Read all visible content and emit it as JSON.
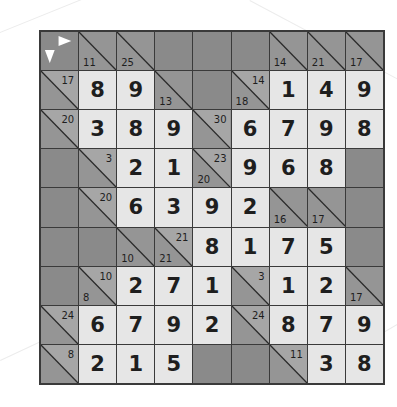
{
  "puzzle": {
    "type": "kakuro",
    "rows": 9,
    "cols": 9,
    "colors": {
      "value_bg": "#e6e6e6",
      "clue_bg": "#959595",
      "black_bg": "#8a8a8a",
      "grid_line": "#3a3a3a",
      "text": "#1e1e1e"
    },
    "cells": [
      [
        {
          "t": "corner"
        },
        {
          "t": "clue",
          "down": "11"
        },
        {
          "t": "clue",
          "down": "25"
        },
        {
          "t": "black"
        },
        {
          "t": "black"
        },
        {
          "t": "black"
        },
        {
          "t": "clue",
          "down": "14"
        },
        {
          "t": "clue",
          "down": "21"
        },
        {
          "t": "clue",
          "down": "17"
        }
      ],
      [
        {
          "t": "clue",
          "right": "17"
        },
        {
          "t": "val",
          "v": "8"
        },
        {
          "t": "val",
          "v": "9"
        },
        {
          "t": "clue",
          "down": "13"
        },
        {
          "t": "black"
        },
        {
          "t": "clue",
          "down": "18",
          "right": "14"
        },
        {
          "t": "val",
          "v": "1"
        },
        {
          "t": "val",
          "v": "4"
        },
        {
          "t": "val",
          "v": "9"
        }
      ],
      [
        {
          "t": "clue",
          "right": "20"
        },
        {
          "t": "val",
          "v": "3"
        },
        {
          "t": "val",
          "v": "8"
        },
        {
          "t": "val",
          "v": "9"
        },
        {
          "t": "clue",
          "right": "30"
        },
        {
          "t": "val",
          "v": "6"
        },
        {
          "t": "val",
          "v": "7"
        },
        {
          "t": "val",
          "v": "9"
        },
        {
          "t": "val",
          "v": "8"
        }
      ],
      [
        {
          "t": "black"
        },
        {
          "t": "clue",
          "right": "3"
        },
        {
          "t": "val",
          "v": "2"
        },
        {
          "t": "val",
          "v": "1"
        },
        {
          "t": "clue",
          "down": "20",
          "right": "23"
        },
        {
          "t": "val",
          "v": "9"
        },
        {
          "t": "val",
          "v": "6"
        },
        {
          "t": "val",
          "v": "8"
        },
        {
          "t": "black"
        }
      ],
      [
        {
          "t": "black"
        },
        {
          "t": "clue",
          "right": "20"
        },
        {
          "t": "val",
          "v": "6"
        },
        {
          "t": "val",
          "v": "3"
        },
        {
          "t": "val",
          "v": "9"
        },
        {
          "t": "val",
          "v": "2"
        },
        {
          "t": "clue",
          "down": "16"
        },
        {
          "t": "clue",
          "down": "17"
        },
        {
          "t": "black"
        }
      ],
      [
        {
          "t": "black"
        },
        {
          "t": "black"
        },
        {
          "t": "clue",
          "down": "10"
        },
        {
          "t": "clue",
          "down": "21",
          "right": "21"
        },
        {
          "t": "val",
          "v": "8"
        },
        {
          "t": "val",
          "v": "1"
        },
        {
          "t": "val",
          "v": "7"
        },
        {
          "t": "val",
          "v": "5"
        },
        {
          "t": "black"
        }
      ],
      [
        {
          "t": "black"
        },
        {
          "t": "clue",
          "down": "8",
          "right": "10"
        },
        {
          "t": "val",
          "v": "2"
        },
        {
          "t": "val",
          "v": "7"
        },
        {
          "t": "val",
          "v": "1"
        },
        {
          "t": "clue",
          "right": "3"
        },
        {
          "t": "val",
          "v": "1"
        },
        {
          "t": "val",
          "v": "2"
        },
        {
          "t": "clue",
          "down": "17"
        }
      ],
      [
        {
          "t": "clue",
          "right": "24"
        },
        {
          "t": "val",
          "v": "6"
        },
        {
          "t": "val",
          "v": "7"
        },
        {
          "t": "val",
          "v": "9"
        },
        {
          "t": "val",
          "v": "2"
        },
        {
          "t": "clue",
          "right": "24"
        },
        {
          "t": "val",
          "v": "8"
        },
        {
          "t": "val",
          "v": "7"
        },
        {
          "t": "val",
          "v": "9"
        }
      ],
      [
        {
          "t": "clue",
          "right": "8"
        },
        {
          "t": "val",
          "v": "2"
        },
        {
          "t": "val",
          "v": "1"
        },
        {
          "t": "val",
          "v": "5"
        },
        {
          "t": "black"
        },
        {
          "t": "black"
        },
        {
          "t": "clue",
          "right": "11"
        },
        {
          "t": "val",
          "v": "3"
        },
        {
          "t": "val",
          "v": "8"
        }
      ]
    ]
  },
  "icons": {
    "corner": "direction-arrows-icon"
  }
}
